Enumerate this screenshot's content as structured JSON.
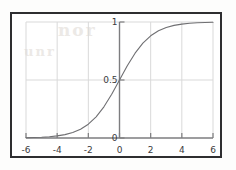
{
  "figure": {
    "background_color": "#ffffff",
    "frame_color": "#2e2e30",
    "grid_color": "#d9d9d9",
    "axis_color": "#7d7d7f",
    "curve_color": "#6f6f72",
    "label_color": "#3a3a3c"
  },
  "bleed_through": {
    "text_a": "nor",
    "text_b": "unr"
  },
  "chart_data": {
    "type": "line",
    "title": "",
    "subtitle": "",
    "xlabel": "",
    "ylabel": "",
    "xlim": [
      -6,
      6
    ],
    "ylim": [
      0,
      1
    ],
    "grid": true,
    "legend": null,
    "annotations": [],
    "xticks": [
      -6,
      -4,
      -2,
      0,
      2,
      4,
      6
    ],
    "xtick_labels": [
      "-6",
      "-4",
      "-2",
      "0",
      "2",
      "4",
      "6"
    ],
    "yticks": [
      0,
      0.5,
      1
    ],
    "ytick_labels": [
      "0",
      "0.5",
      "1"
    ],
    "series": [
      {
        "name": "sigmoid",
        "formula": "1 / (1 + exp(-x))",
        "x": [
          -6,
          -5.5,
          -5,
          -4.5,
          -4,
          -3.5,
          -3,
          -2.5,
          -2,
          -1.5,
          -1,
          -0.5,
          0,
          0.5,
          1,
          1.5,
          2,
          2.5,
          3,
          3.5,
          4,
          4.5,
          5,
          5.5,
          6
        ],
        "values": [
          0.0025,
          0.0041,
          0.0067,
          0.011,
          0.018,
          0.0293,
          0.0474,
          0.0759,
          0.1192,
          0.1824,
          0.2689,
          0.3775,
          0.5,
          0.6225,
          0.7311,
          0.8176,
          0.8808,
          0.9241,
          0.9526,
          0.9707,
          0.982,
          0.989,
          0.9933,
          0.9959,
          0.9975
        ]
      }
    ]
  }
}
